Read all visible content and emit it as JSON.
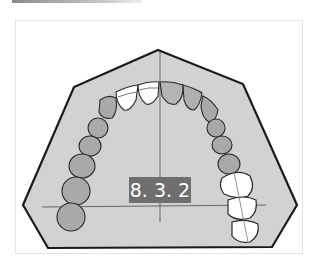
{
  "figure": {
    "label": "8. 3. 2",
    "colors": {
      "palate_fill": "#d2d2d2",
      "outline": "#1a1a1a",
      "tooth_shaded": "#a8a8a8",
      "tooth_white": "#ffffff",
      "label_bg": "#6e6e6e",
      "label_text": "#ffffff"
    },
    "teeth": {
      "left_side": "shaded",
      "right_posterior": "white (outlined)",
      "incisors_left": "white (outlined)"
    }
  }
}
